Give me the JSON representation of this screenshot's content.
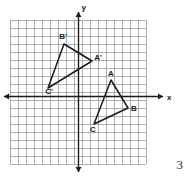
{
  "page": {
    "number": "3"
  },
  "figure": {
    "axes": {
      "x_label": "x",
      "y_label": "y",
      "grid_on": true,
      "grid_color": "#8c8c8c",
      "axis_color": "#1a1a1a",
      "grid_cell_px": 8,
      "grid_left_px": 10,
      "grid_top_px": 20,
      "grid_cols": 17,
      "grid_rows": 18,
      "origin_x_px": 78,
      "origin_y_px": 96,
      "x_axis_arrow_left_px": 4,
      "x_axis_arrow_right_px": 163,
      "y_axis_arrow_top_px": 12,
      "y_axis_arrow_bottom_px": 172
    },
    "shape_color": "#1a1a1a",
    "triangles": [
      {
        "name": "triangle-abc",
        "vertices": [
          {
            "label": "A",
            "x_px": 111,
            "y_px": 80,
            "label_x_px": 111,
            "label_y_px": 76
          },
          {
            "label": "B",
            "x_px": 128,
            "y_px": 108,
            "label_x_px": 134,
            "label_y_px": 111
          },
          {
            "label": "C",
            "x_px": 94,
            "y_px": 124,
            "label_x_px": 93,
            "label_y_px": 132
          }
        ]
      },
      {
        "name": "triangle-a-prime-b-prime-c-prime",
        "vertices": [
          {
            "label": "B'",
            "x_px": 64,
            "y_px": 44,
            "label_x_px": 63,
            "label_y_px": 39
          },
          {
            "label": "A'",
            "x_px": 92,
            "y_px": 61,
            "label_x_px": 98,
            "label_y_px": 60
          },
          {
            "label": "C'",
            "x_px": 48,
            "y_px": 88,
            "label_x_px": 49,
            "label_y_px": 94
          }
        ]
      }
    ]
  }
}
